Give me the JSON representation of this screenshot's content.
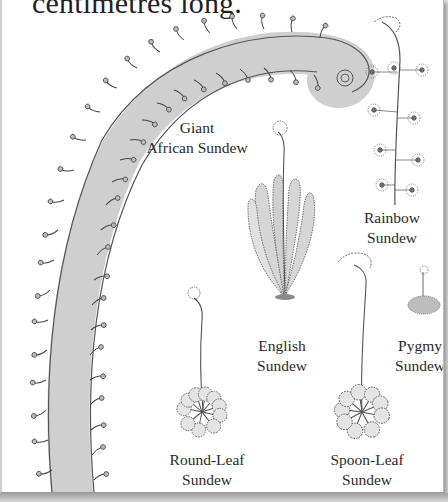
{
  "page": {
    "intro_text": "centimetres long.",
    "background_color": "#ffffff",
    "ink_color": "#2a2a2a",
    "leaf_fill": "#cfcfcf"
  },
  "illustrations": [
    {
      "id": "giant-african-sundew",
      "icon": "giant-african-sundew-drawing"
    },
    {
      "id": "rainbow-sundew",
      "icon": "rainbow-sundew-drawing"
    },
    {
      "id": "english-sundew",
      "icon": "english-sundew-drawing"
    },
    {
      "id": "pygmy-sundew",
      "icon": "pygmy-sundew-drawing"
    },
    {
      "id": "round-leaf-sundew",
      "icon": "round-leaf-sundew-drawing"
    },
    {
      "id": "spoon-leaf-sundew",
      "icon": "spoon-leaf-sundew-drawing"
    }
  ],
  "labels": {
    "giant_african": {
      "line1": "Giant",
      "line2": "African Sundew"
    },
    "rainbow": {
      "line1": "Rainbow",
      "line2": "Sundew"
    },
    "english": {
      "line1": "English",
      "line2": "Sundew"
    },
    "pygmy": {
      "line1": "Pygmy",
      "line2": "Sundew"
    },
    "round_leaf": {
      "line1": "Round-Leaf",
      "line2": "Sundew"
    },
    "spoon_leaf": {
      "line1": "Spoon-Leaf",
      "line2": "Sundew"
    }
  }
}
